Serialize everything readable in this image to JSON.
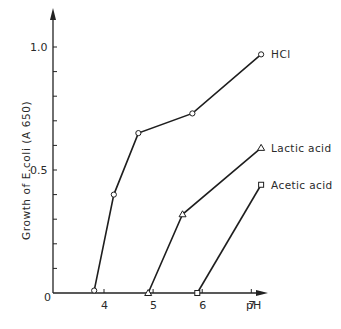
{
  "chart_data": {
    "type": "line",
    "title": "",
    "xlabel": "pH",
    "ylabel": "Growth of E.coli (A 650)",
    "xlim": [
      3.0,
      8.0
    ],
    "ylim": [
      0,
      1.1
    ],
    "x_ticks": [
      "4",
      "5",
      "6",
      "7"
    ],
    "y_ticks": [
      "0.5",
      "1.0"
    ],
    "origin_label": "0",
    "grid": false,
    "legend": "inline labels at series ends",
    "series": [
      {
        "name": "HCl",
        "marker": "circle",
        "x": [
          3.8,
          4.2,
          4.7,
          5.8,
          7.2
        ],
        "y": [
          0.01,
          0.4,
          0.65,
          0.73,
          0.97
        ]
      },
      {
        "name": "Lactic acid",
        "marker": "triangle",
        "x": [
          4.9,
          5.6,
          7.2
        ],
        "y": [
          0.0,
          0.32,
          0.59
        ]
      },
      {
        "name": "Acetic acid",
        "marker": "square",
        "x": [
          5.9,
          7.2
        ],
        "y": [
          0.0,
          0.44
        ]
      }
    ]
  }
}
